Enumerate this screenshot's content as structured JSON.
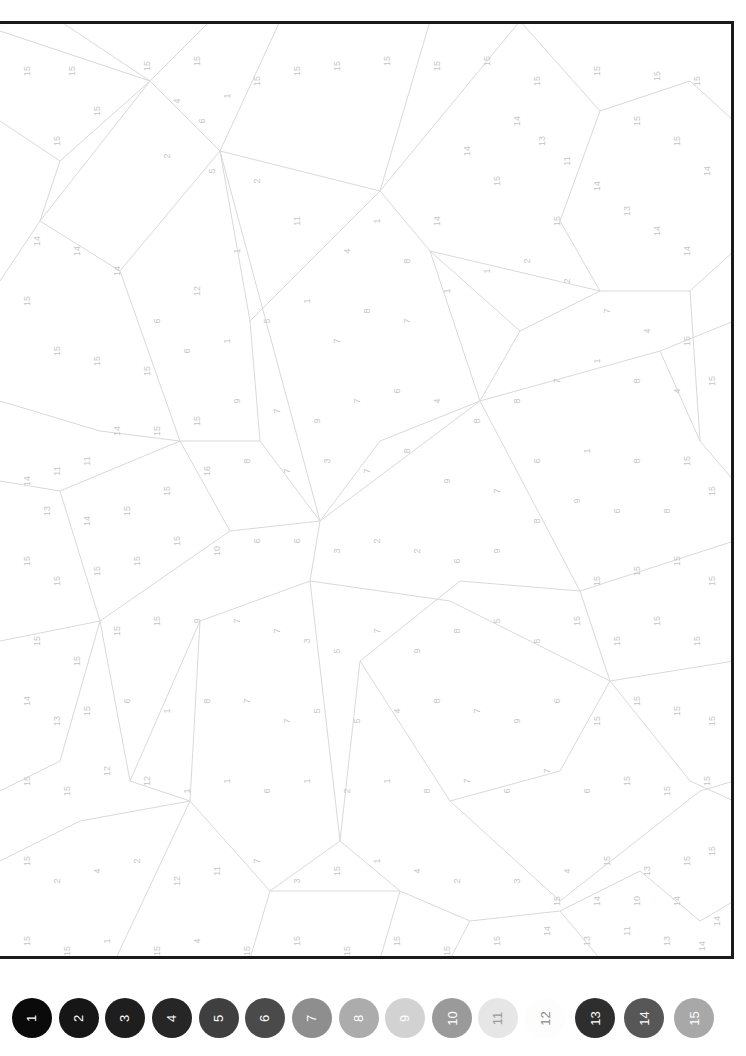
{
  "page": {
    "type": "paint-by-numbers",
    "orientation": "rotated-90"
  },
  "canvas": {
    "frame_color": "#1a1a1a",
    "line_color": "#d6d6d6",
    "label_color": "#c4c4c4",
    "labels": [
      {
        "x": 30,
        "y": 50,
        "t": "15"
      },
      {
        "x": 75,
        "y": 50,
        "t": "15"
      },
      {
        "x": 150,
        "y": 45,
        "t": "15"
      },
      {
        "x": 200,
        "y": 40,
        "t": "15"
      },
      {
        "x": 100,
        "y": 90,
        "t": "15"
      },
      {
        "x": 60,
        "y": 120,
        "t": "15"
      },
      {
        "x": 180,
        "y": 80,
        "t": "4"
      },
      {
        "x": 205,
        "y": 100,
        "t": "6"
      },
      {
        "x": 230,
        "y": 75,
        "t": "1"
      },
      {
        "x": 170,
        "y": 135,
        "t": "2"
      },
      {
        "x": 215,
        "y": 150,
        "t": "5"
      },
      {
        "x": 260,
        "y": 60,
        "t": "15"
      },
      {
        "x": 300,
        "y": 50,
        "t": "15"
      },
      {
        "x": 340,
        "y": 45,
        "t": "15"
      },
      {
        "x": 390,
        "y": 40,
        "t": "15"
      },
      {
        "x": 440,
        "y": 45,
        "t": "15"
      },
      {
        "x": 490,
        "y": 40,
        "t": "15"
      },
      {
        "x": 540,
        "y": 60,
        "t": "15"
      },
      {
        "x": 600,
        "y": 50,
        "t": "15"
      },
      {
        "x": 660,
        "y": 55,
        "t": "15"
      },
      {
        "x": 700,
        "y": 60,
        "t": "15"
      },
      {
        "x": 640,
        "y": 100,
        "t": "15"
      },
      {
        "x": 680,
        "y": 120,
        "t": "15"
      },
      {
        "x": 710,
        "y": 150,
        "t": "14"
      },
      {
        "x": 520,
        "y": 100,
        "t": "14"
      },
      {
        "x": 545,
        "y": 120,
        "t": "13"
      },
      {
        "x": 570,
        "y": 140,
        "t": "11"
      },
      {
        "x": 600,
        "y": 165,
        "t": "14"
      },
      {
        "x": 630,
        "y": 190,
        "t": "13"
      },
      {
        "x": 660,
        "y": 210,
        "t": "14"
      },
      {
        "x": 690,
        "y": 230,
        "t": "14"
      },
      {
        "x": 560,
        "y": 200,
        "t": "15"
      },
      {
        "x": 500,
        "y": 160,
        "t": "15"
      },
      {
        "x": 470,
        "y": 130,
        "t": "14"
      },
      {
        "x": 440,
        "y": 200,
        "t": "14"
      },
      {
        "x": 410,
        "y": 240,
        "t": "8"
      },
      {
        "x": 380,
        "y": 200,
        "t": "1"
      },
      {
        "x": 350,
        "y": 230,
        "t": "4"
      },
      {
        "x": 300,
        "y": 200,
        "t": "11"
      },
      {
        "x": 260,
        "y": 160,
        "t": "2"
      },
      {
        "x": 240,
        "y": 230,
        "t": "1"
      },
      {
        "x": 200,
        "y": 270,
        "t": "12"
      },
      {
        "x": 160,
        "y": 300,
        "t": "6"
      },
      {
        "x": 120,
        "y": 250,
        "t": "14"
      },
      {
        "x": 80,
        "y": 230,
        "t": "14"
      },
      {
        "x": 40,
        "y": 220,
        "t": "14"
      },
      {
        "x": 30,
        "y": 280,
        "t": "15"
      },
      {
        "x": 60,
        "y": 330,
        "t": "15"
      },
      {
        "x": 100,
        "y": 340,
        "t": "15"
      },
      {
        "x": 150,
        "y": 350,
        "t": "15"
      },
      {
        "x": 190,
        "y": 330,
        "t": "6"
      },
      {
        "x": 230,
        "y": 320,
        "t": "1"
      },
      {
        "x": 270,
        "y": 300,
        "t": "5"
      },
      {
        "x": 310,
        "y": 280,
        "t": "1"
      },
      {
        "x": 340,
        "y": 320,
        "t": "7"
      },
      {
        "x": 370,
        "y": 290,
        "t": "8"
      },
      {
        "x": 410,
        "y": 300,
        "t": "7"
      },
      {
        "x": 450,
        "y": 270,
        "t": "1"
      },
      {
        "x": 490,
        "y": 250,
        "t": "1"
      },
      {
        "x": 530,
        "y": 240,
        "t": "2"
      },
      {
        "x": 570,
        "y": 260,
        "t": "2"
      },
      {
        "x": 610,
        "y": 290,
        "t": "7"
      },
      {
        "x": 650,
        "y": 310,
        "t": "4"
      },
      {
        "x": 690,
        "y": 320,
        "t": "15"
      },
      {
        "x": 715,
        "y": 360,
        "t": "15"
      },
      {
        "x": 680,
        "y": 370,
        "t": "4"
      },
      {
        "x": 640,
        "y": 360,
        "t": "8"
      },
      {
        "x": 600,
        "y": 340,
        "t": "1"
      },
      {
        "x": 560,
        "y": 360,
        "t": "7"
      },
      {
        "x": 520,
        "y": 380,
        "t": "8"
      },
      {
        "x": 480,
        "y": 400,
        "t": "8"
      },
      {
        "x": 440,
        "y": 380,
        "t": "4"
      },
      {
        "x": 400,
        "y": 370,
        "t": "6"
      },
      {
        "x": 360,
        "y": 380,
        "t": "7"
      },
      {
        "x": 320,
        "y": 400,
        "t": "9"
      },
      {
        "x": 280,
        "y": 390,
        "t": "7"
      },
      {
        "x": 240,
        "y": 380,
        "t": "9"
      },
      {
        "x": 200,
        "y": 400,
        "t": "15"
      },
      {
        "x": 160,
        "y": 410,
        "t": "15"
      },
      {
        "x": 120,
        "y": 410,
        "t": "14"
      },
      {
        "x": 90,
        "y": 440,
        "t": "11"
      },
      {
        "x": 60,
        "y": 450,
        "t": "11"
      },
      {
        "x": 30,
        "y": 460,
        "t": "14"
      },
      {
        "x": 50,
        "y": 490,
        "t": "13"
      },
      {
        "x": 90,
        "y": 500,
        "t": "14"
      },
      {
        "x": 130,
        "y": 490,
        "t": "15"
      },
      {
        "x": 170,
        "y": 470,
        "t": "15"
      },
      {
        "x": 210,
        "y": 450,
        "t": "16"
      },
      {
        "x": 250,
        "y": 440,
        "t": "8"
      },
      {
        "x": 290,
        "y": 450,
        "t": "7"
      },
      {
        "x": 330,
        "y": 440,
        "t": "3"
      },
      {
        "x": 370,
        "y": 450,
        "t": "7"
      },
      {
        "x": 410,
        "y": 430,
        "t": "8"
      },
      {
        "x": 450,
        "y": 460,
        "t": "9"
      },
      {
        "x": 500,
        "y": 470,
        "t": "7"
      },
      {
        "x": 540,
        "y": 440,
        "t": "6"
      },
      {
        "x": 590,
        "y": 430,
        "t": "1"
      },
      {
        "x": 640,
        "y": 440,
        "t": "8"
      },
      {
        "x": 690,
        "y": 440,
        "t": "15"
      },
      {
        "x": 715,
        "y": 470,
        "t": "15"
      },
      {
        "x": 670,
        "y": 490,
        "t": "8"
      },
      {
        "x": 620,
        "y": 490,
        "t": "6"
      },
      {
        "x": 580,
        "y": 480,
        "t": "9"
      },
      {
        "x": 540,
        "y": 500,
        "t": "8"
      },
      {
        "x": 500,
        "y": 530,
        "t": "9"
      },
      {
        "x": 460,
        "y": 540,
        "t": "6"
      },
      {
        "x": 420,
        "y": 530,
        "t": "2"
      },
      {
        "x": 380,
        "y": 520,
        "t": "2"
      },
      {
        "x": 340,
        "y": 530,
        "t": "3"
      },
      {
        "x": 300,
        "y": 520,
        "t": "6"
      },
      {
        "x": 260,
        "y": 520,
        "t": "6"
      },
      {
        "x": 220,
        "y": 530,
        "t": "10"
      },
      {
        "x": 180,
        "y": 520,
        "t": "15"
      },
      {
        "x": 140,
        "y": 540,
        "t": "15"
      },
      {
        "x": 100,
        "y": 550,
        "t": "15"
      },
      {
        "x": 60,
        "y": 560,
        "t": "15"
      },
      {
        "x": 30,
        "y": 540,
        "t": "15"
      },
      {
        "x": 40,
        "y": 620,
        "t": "15"
      },
      {
        "x": 80,
        "y": 640,
        "t": "15"
      },
      {
        "x": 120,
        "y": 610,
        "t": "15"
      },
      {
        "x": 160,
        "y": 600,
        "t": "15"
      },
      {
        "x": 200,
        "y": 600,
        "t": "9"
      },
      {
        "x": 240,
        "y": 600,
        "t": "7"
      },
      {
        "x": 280,
        "y": 610,
        "t": "7"
      },
      {
        "x": 310,
        "y": 620,
        "t": "3"
      },
      {
        "x": 340,
        "y": 630,
        "t": "5"
      },
      {
        "x": 380,
        "y": 610,
        "t": "7"
      },
      {
        "x": 420,
        "y": 630,
        "t": "9"
      },
      {
        "x": 460,
        "y": 610,
        "t": "8"
      },
      {
        "x": 500,
        "y": 600,
        "t": "5"
      },
      {
        "x": 540,
        "y": 620,
        "t": "5"
      },
      {
        "x": 580,
        "y": 600,
        "t": "15"
      },
      {
        "x": 620,
        "y": 620,
        "t": "15"
      },
      {
        "x": 660,
        "y": 600,
        "t": "15"
      },
      {
        "x": 700,
        "y": 620,
        "t": "15"
      },
      {
        "x": 715,
        "y": 560,
        "t": "15"
      },
      {
        "x": 680,
        "y": 540,
        "t": "15"
      },
      {
        "x": 640,
        "y": 550,
        "t": "15"
      },
      {
        "x": 600,
        "y": 560,
        "t": "15"
      },
      {
        "x": 30,
        "y": 680,
        "t": "14"
      },
      {
        "x": 60,
        "y": 700,
        "t": "13"
      },
      {
        "x": 90,
        "y": 690,
        "t": "15"
      },
      {
        "x": 130,
        "y": 680,
        "t": "6"
      },
      {
        "x": 170,
        "y": 690,
        "t": "1"
      },
      {
        "x": 210,
        "y": 680,
        "t": "8"
      },
      {
        "x": 250,
        "y": 680,
        "t": "7"
      },
      {
        "x": 290,
        "y": 700,
        "t": "7"
      },
      {
        "x": 320,
        "y": 690,
        "t": "5"
      },
      {
        "x": 360,
        "y": 700,
        "t": "5"
      },
      {
        "x": 400,
        "y": 690,
        "t": "4"
      },
      {
        "x": 440,
        "y": 680,
        "t": "8"
      },
      {
        "x": 480,
        "y": 690,
        "t": "7"
      },
      {
        "x": 520,
        "y": 700,
        "t": "9"
      },
      {
        "x": 560,
        "y": 680,
        "t": "6"
      },
      {
        "x": 600,
        "y": 700,
        "t": "15"
      },
      {
        "x": 640,
        "y": 680,
        "t": "15"
      },
      {
        "x": 680,
        "y": 690,
        "t": "15"
      },
      {
        "x": 715,
        "y": 700,
        "t": "15"
      },
      {
        "x": 30,
        "y": 760,
        "t": "15"
      },
      {
        "x": 70,
        "y": 770,
        "t": "15"
      },
      {
        "x": 110,
        "y": 750,
        "t": "12"
      },
      {
        "x": 150,
        "y": 760,
        "t": "12"
      },
      {
        "x": 190,
        "y": 770,
        "t": "1"
      },
      {
        "x": 230,
        "y": 760,
        "t": "1"
      },
      {
        "x": 270,
        "y": 770,
        "t": "6"
      },
      {
        "x": 310,
        "y": 760,
        "t": "1"
      },
      {
        "x": 350,
        "y": 770,
        "t": "2"
      },
      {
        "x": 390,
        "y": 760,
        "t": "1"
      },
      {
        "x": 430,
        "y": 770,
        "t": "8"
      },
      {
        "x": 470,
        "y": 760,
        "t": "7"
      },
      {
        "x": 510,
        "y": 770,
        "t": "6"
      },
      {
        "x": 550,
        "y": 750,
        "t": "7"
      },
      {
        "x": 590,
        "y": 770,
        "t": "6"
      },
      {
        "x": 630,
        "y": 760,
        "t": "15"
      },
      {
        "x": 670,
        "y": 770,
        "t": "15"
      },
      {
        "x": 710,
        "y": 760,
        "t": "15"
      },
      {
        "x": 30,
        "y": 840,
        "t": "15"
      },
      {
        "x": 60,
        "y": 860,
        "t": "2"
      },
      {
        "x": 100,
        "y": 850,
        "t": "4"
      },
      {
        "x": 140,
        "y": 840,
        "t": "2"
      },
      {
        "x": 180,
        "y": 860,
        "t": "12"
      },
      {
        "x": 220,
        "y": 850,
        "t": "11"
      },
      {
        "x": 260,
        "y": 840,
        "t": "7"
      },
      {
        "x": 300,
        "y": 860,
        "t": "3"
      },
      {
        "x": 340,
        "y": 850,
        "t": "15"
      },
      {
        "x": 380,
        "y": 840,
        "t": "1"
      },
      {
        "x": 420,
        "y": 850,
        "t": "4"
      },
      {
        "x": 460,
        "y": 860,
        "t": "2"
      },
      {
        "x": 520,
        "y": 860,
        "t": "3"
      },
      {
        "x": 570,
        "y": 850,
        "t": "4"
      },
      {
        "x": 610,
        "y": 840,
        "t": "15"
      },
      {
        "x": 650,
        "y": 850,
        "t": "13"
      },
      {
        "x": 690,
        "y": 840,
        "t": "15"
      },
      {
        "x": 715,
        "y": 830,
        "t": "15"
      },
      {
        "x": 30,
        "y": 920,
        "t": "15"
      },
      {
        "x": 70,
        "y": 930,
        "t": "15"
      },
      {
        "x": 110,
        "y": 920,
        "t": "1"
      },
      {
        "x": 160,
        "y": 930,
        "t": "15"
      },
      {
        "x": 200,
        "y": 920,
        "t": "4"
      },
      {
        "x": 250,
        "y": 930,
        "t": "15"
      },
      {
        "x": 300,
        "y": 920,
        "t": "15"
      },
      {
        "x": 350,
        "y": 930,
        "t": "15"
      },
      {
        "x": 400,
        "y": 920,
        "t": "15"
      },
      {
        "x": 450,
        "y": 930,
        "t": "15"
      },
      {
        "x": 500,
        "y": 920,
        "t": "15"
      },
      {
        "x": 550,
        "y": 910,
        "t": "14"
      },
      {
        "x": 590,
        "y": 920,
        "t": "13"
      },
      {
        "x": 630,
        "y": 910,
        "t": "11"
      },
      {
        "x": 670,
        "y": 920,
        "t": "13"
      },
      {
        "x": 705,
        "y": 925,
        "t": "14"
      },
      {
        "x": 560,
        "y": 880,
        "t": "15"
      },
      {
        "x": 600,
        "y": 880,
        "t": "14"
      },
      {
        "x": 640,
        "y": 880,
        "t": "10"
      },
      {
        "x": 680,
        "y": 880,
        "t": "14"
      },
      {
        "x": 720,
        "y": 900,
        "t": "14"
      }
    ]
  },
  "palette": {
    "swatches": [
      {
        "number": "1",
        "color": "#0a0a0a",
        "text_color": "#ffffff"
      },
      {
        "number": "2",
        "color": "#161616",
        "text_color": "#ffffff"
      },
      {
        "number": "3",
        "color": "#1e1e1e",
        "text_color": "#ffffff"
      },
      {
        "number": "4",
        "color": "#262626",
        "text_color": "#ffffff"
      },
      {
        "number": "5",
        "color": "#3f3f3f",
        "text_color": "#ffffff"
      },
      {
        "number": "6",
        "color": "#4a4a4a",
        "text_color": "#ffffff"
      },
      {
        "number": "7",
        "color": "#8e8e8e",
        "text_color": "#ffffff"
      },
      {
        "number": "8",
        "color": "#acacac",
        "text_color": "#ffffff"
      },
      {
        "number": "9",
        "color": "#d2d2d2",
        "text_color": "#ffffff"
      },
      {
        "number": "10",
        "color": "#9a9a9a",
        "text_color": "#ffffff"
      },
      {
        "number": "11",
        "color": "#e6e6e6",
        "text_color": "#9a9a9a"
      },
      {
        "number": "12",
        "color": "#fdfdfd",
        "text_color": "#8a8a8a"
      },
      {
        "number": "13",
        "color": "#2e2e2e",
        "text_color": "#ffffff"
      },
      {
        "number": "14",
        "color": "#575757",
        "text_color": "#ffffff"
      },
      {
        "number": "15",
        "color": "#a8a8a8",
        "text_color": "#ffffff"
      }
    ]
  }
}
